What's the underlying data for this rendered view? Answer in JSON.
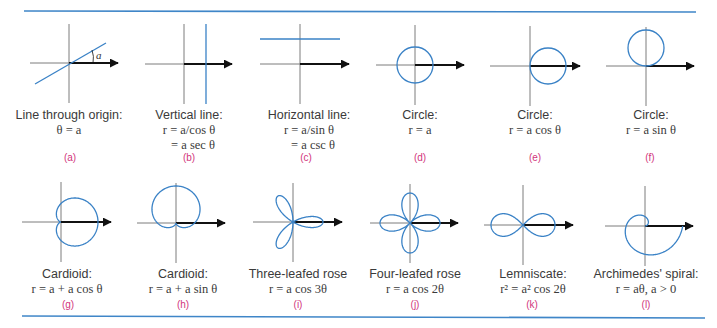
{
  "colors": {
    "rule": "#3f86c8",
    "curve": "#3a82c6",
    "axis": "#6e6e6e",
    "arrow": "#111111",
    "caption_text": "#3a3a3a",
    "panel_letter": "#d2357c"
  },
  "panels": [
    {
      "id": "a",
      "letter": "(a)",
      "title": "Line through origin:",
      "formula": [
        "θ = a"
      ],
      "angle_label": "a",
      "curve": "line-through-origin"
    },
    {
      "id": "b",
      "letter": "(b)",
      "title": "Vertical line:",
      "formula": [
        "r = a/cos θ",
        "= a sec θ"
      ],
      "curve": "vertical-line"
    },
    {
      "id": "c",
      "letter": "(c)",
      "title": "Horizontal line:",
      "formula": [
        "r = a/sin θ",
        "= a csc θ"
      ],
      "curve": "horizontal-line"
    },
    {
      "id": "d",
      "letter": "(d)",
      "title": "Circle:",
      "formula": [
        "r = a"
      ],
      "curve": "circle-centered"
    },
    {
      "id": "e",
      "letter": "(e)",
      "title": "Circle:",
      "formula": [
        "r = a cos θ"
      ],
      "curve": "circle-right"
    },
    {
      "id": "f",
      "letter": "(f)",
      "title": "Circle:",
      "formula": [
        "r = a sin θ"
      ],
      "curve": "circle-up"
    },
    {
      "id": "g",
      "letter": "(g)",
      "title": "Cardioid:",
      "formula": [
        "r = a + a cos θ"
      ],
      "curve": "cardioid-cos"
    },
    {
      "id": "h",
      "letter": "(h)",
      "title": "Cardioid:",
      "formula": [
        "r = a + a sin θ"
      ],
      "curve": "cardioid-sin"
    },
    {
      "id": "i",
      "letter": "(i)",
      "title": "Three-leafed rose",
      "formula": [
        "r = a cos 3θ"
      ],
      "curve": "rose-3"
    },
    {
      "id": "j",
      "letter": "(j)",
      "title": "Four-leafed rose",
      "formula": [
        "r = a cos 2θ"
      ],
      "curve": "rose-4"
    },
    {
      "id": "k",
      "letter": "(k)",
      "title": "Lemniscate:",
      "formula": [
        "r² = a² cos 2θ"
      ],
      "curve": "lemniscate"
    },
    {
      "id": "l",
      "letter": "(l)",
      "title": "Archimedes' spiral:",
      "formula": [
        "r = aθ, a > 0"
      ],
      "curve": "archimedes-spiral"
    }
  ]
}
